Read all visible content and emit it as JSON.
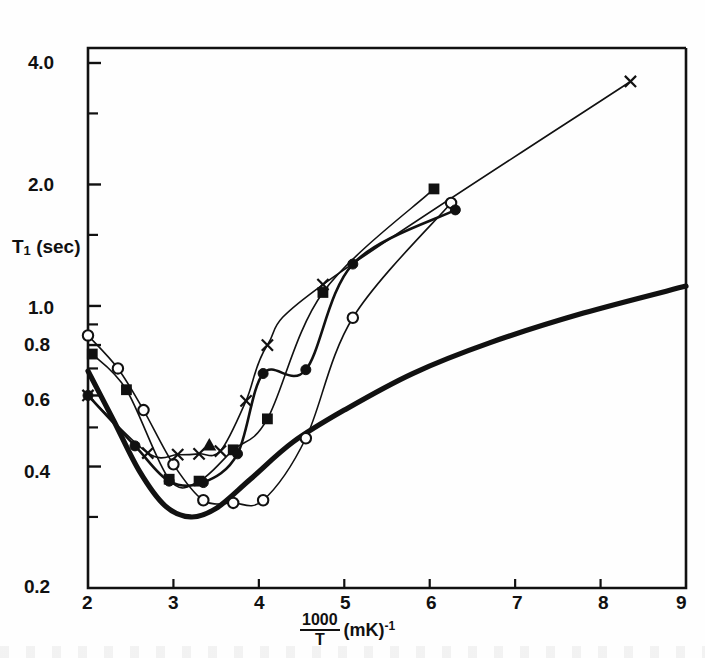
{
  "figure": {
    "kind": "scientific-log-log-plot",
    "background": "#fefefe",
    "ink": "#111111"
  },
  "chart_data": {
    "type": "line",
    "title": "",
    "subtitle": "",
    "xlabel": "1000/T (mK)^-1",
    "xlabel_parts": {
      "numerator": "1000",
      "denominator": "T",
      "unit": "(mK)",
      "exponent": "-1"
    },
    "ylabel": "T1 (sec)",
    "ylabel_parts": {
      "symbol": "T",
      "subscript": "1",
      "unit": "(sec)"
    },
    "xscale": "linear",
    "yscale": "log",
    "xlim": [
      2,
      9
    ],
    "ylim": [
      0.2,
      4.6
    ],
    "grid": false,
    "legend_position": "none",
    "xticks": [
      2,
      3,
      4,
      5,
      6,
      7,
      8,
      9
    ],
    "xticklabels": [
      "2",
      "3",
      "4",
      "5",
      "6",
      "7",
      "8",
      "9"
    ],
    "yticks_labeled": [
      4.0,
      2.0,
      1.0,
      0.8,
      0.6,
      0.4,
      0.2
    ],
    "yticklabels": [
      "4.0",
      "2.0",
      "1.0",
      "0.8",
      "0.6",
      "0.4",
      "0.2"
    ],
    "yticks_minor": [
      3.0,
      1.5,
      0.9,
      0.7,
      0.5,
      0.3
    ],
    "series": [
      {
        "name": "open-circle-series",
        "marker": "open-circle",
        "linewidth": "thin",
        "x": [
          2.0,
          2.35,
          2.65,
          3.0,
          3.35,
          3.7,
          4.05,
          4.55,
          5.1,
          6.25
        ],
        "y": [
          0.845,
          0.7,
          0.552,
          0.405,
          0.33,
          0.325,
          0.33,
          0.47,
          0.935,
          1.8
        ]
      },
      {
        "name": "filled-square-series",
        "marker": "filled-square",
        "linewidth": "thin",
        "x": [
          2.05,
          2.45,
          2.95,
          3.3,
          3.7,
          4.1,
          4.75,
          6.05
        ],
        "y": [
          0.76,
          0.62,
          0.372,
          0.368,
          0.44,
          0.525,
          1.08,
          1.95
        ]
      },
      {
        "name": "filled-circle-series",
        "marker": "filled-circle",
        "linewidth": "medium",
        "x": [
          2.0,
          2.55,
          2.95,
          3.35,
          3.75,
          4.05,
          4.55,
          5.1,
          6.3
        ],
        "y": [
          0.6,
          0.45,
          0.368,
          0.365,
          0.43,
          0.68,
          0.695,
          1.27,
          1.73
        ]
      },
      {
        "name": "cross-series",
        "marker": "x-cross",
        "linewidth": "thin",
        "x": [
          2.0,
          2.7,
          3.05,
          3.3,
          3.55,
          3.85,
          4.1,
          4.75,
          8.35
        ],
        "y": [
          0.6,
          0.432,
          0.428,
          0.43,
          0.437,
          0.582,
          0.8,
          1.13,
          3.6
        ]
      },
      {
        "name": "filled-triangle-point",
        "marker": "filled-triangle",
        "linewidth": "none",
        "x": [
          3.42
        ],
        "y": [
          0.452
        ]
      },
      {
        "name": "theory-thick-curve",
        "marker": "none",
        "linewidth": "thick",
        "x": [
          2.0,
          2.3,
          2.6,
          2.9,
          3.2,
          3.5,
          3.9,
          4.4,
          5.0,
          5.8,
          6.7,
          7.8,
          9.0
        ],
        "y": [
          0.69,
          0.52,
          0.39,
          0.32,
          0.3,
          0.315,
          0.372,
          0.46,
          0.552,
          0.68,
          0.81,
          0.96,
          1.12
        ]
      }
    ],
    "annotations": []
  },
  "axes": {
    "left_label": "T1 (sec)",
    "x_axis_fraction_numerator": "1000",
    "x_axis_fraction_denominator": "T",
    "x_axis_unit": "(mK)",
    "x_axis_exponent": "-1"
  }
}
